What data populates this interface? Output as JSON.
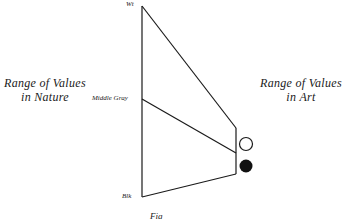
{
  "diagram": {
    "left_label": {
      "line1": "Range of Values",
      "line2": "in Nature"
    },
    "right_label": {
      "line1": "Range of Values",
      "line2": "in Art"
    },
    "scale_labels": {
      "top": "Wt",
      "middle": "Middle Gray",
      "bottom": "Blk"
    },
    "caption": "Fig",
    "colors": {
      "line": "#1a1a1a",
      "background": "#ffffff"
    },
    "legend_markers": [
      {
        "shape": "open-circle",
        "meaning": "white"
      },
      {
        "shape": "filled-circle",
        "meaning": "black"
      }
    ]
  }
}
